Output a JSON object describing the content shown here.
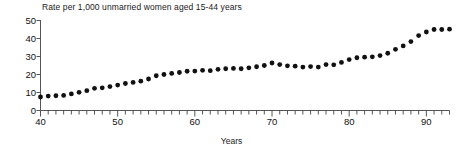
{
  "chart_data": {
    "type": "scatter",
    "title": "Rate per 1,000 unmarried women aged 15-44 years",
    "xlabel": "Years",
    "ylabel": "",
    "xlim": [
      40,
      93
    ],
    "ylim": [
      0,
      50
    ],
    "grid": false,
    "legend": null,
    "marker": "filled-circle",
    "marker_color": "#111111",
    "axis_color": "#555555",
    "x_major_ticks": [
      40,
      50,
      60,
      70,
      80,
      90
    ],
    "x_major_tick_labels": [
      "40",
      "50",
      "60",
      "70",
      "80",
      "90"
    ],
    "x_minor_tick_step": 1,
    "y_ticks": [
      0,
      10,
      20,
      30,
      40,
      50
    ],
    "y_tick_labels": [
      "0",
      "10",
      "20",
      "30",
      "40",
      "50"
    ],
    "x": [
      40,
      41,
      42,
      43,
      44,
      45,
      46,
      47,
      48,
      49,
      50,
      51,
      52,
      53,
      54,
      55,
      56,
      57,
      58,
      59,
      60,
      61,
      62,
      63,
      64,
      65,
      66,
      67,
      68,
      69,
      70,
      71,
      72,
      73,
      74,
      75,
      76,
      77,
      78,
      79,
      80,
      81,
      82,
      83,
      84,
      85,
      86,
      87,
      88,
      89,
      90,
      91,
      92,
      93
    ],
    "values": [
      7.5,
      8.0,
      8.2,
      8.4,
      9.2,
      10.1,
      11.0,
      12.3,
      12.6,
      13.3,
      14.1,
      15.0,
      15.6,
      16.3,
      17.5,
      19.3,
      20.0,
      20.6,
      21.1,
      21.8,
      21.9,
      22.3,
      22.1,
      22.9,
      23.2,
      23.4,
      23.2,
      23.7,
      24.3,
      25.0,
      26.4,
      25.5,
      24.8,
      24.6,
      24.1,
      24.4,
      24.1,
      25.5,
      25.4,
      26.7,
      28.3,
      29.3,
      29.6,
      29.8,
      30.5,
      31.8,
      34.0,
      35.9,
      38.3,
      41.6,
      43.6,
      45.0,
      45.0,
      45.2
    ],
    "point_count": 54
  },
  "chart_meta": {
    "title_text": "Rate per 1,000 unmarried women aged 15-44 years",
    "xlabel_text": "Years"
  }
}
